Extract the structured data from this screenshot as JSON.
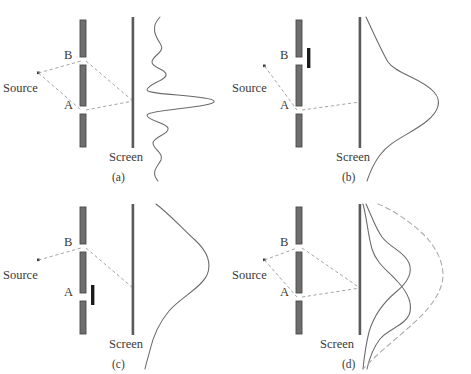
{
  "figure": {
    "colors": {
      "barrier": "#6e6e6e",
      "barrier_edge": "#4a4a4a",
      "blocker": "#1a1a1a",
      "screen": "#5a5a5a",
      "ray": "#9a9a9a",
      "curve": "#6a6a6a",
      "dashed_curve": "#a8a8a8",
      "text": "#3a3a3a",
      "background": "#ffffff"
    },
    "labels": {
      "source": "Source",
      "slit_a": "A",
      "slit_b": "B",
      "screen": "Screen"
    }
  },
  "panels": [
    {
      "id": "a",
      "caption": "(a)",
      "source_label": "Source",
      "slit_b_label": "B",
      "slit_a_label": "A",
      "screen_label": "Screen",
      "slit_a_open": true,
      "slit_b_open": true,
      "rays": [
        "source-to-B",
        "B-to-screen",
        "source-to-A",
        "A-to-screen"
      ],
      "pattern": "two-slit interference fringes",
      "curves": [
        {
          "style": "solid",
          "kind": "interference"
        }
      ]
    },
    {
      "id": "b",
      "caption": "(b)",
      "source_label": "Source",
      "slit_b_label": "B",
      "slit_a_label": "A",
      "screen_label": "Screen",
      "slit_a_open": true,
      "slit_b_open": false,
      "rays": [
        "source-to-A",
        "A-to-screen"
      ],
      "pattern": "single-slit broad maximum through A",
      "curves": [
        {
          "style": "solid",
          "kind": "single-slit-A"
        }
      ]
    },
    {
      "id": "c",
      "caption": "(c)",
      "source_label": "Source",
      "slit_b_label": "B",
      "slit_a_label": "A",
      "screen_label": "Screen",
      "slit_a_open": false,
      "slit_b_open": true,
      "rays": [
        "source-to-B",
        "B-to-screen"
      ],
      "pattern": "single-slit broad maximum through B",
      "curves": [
        {
          "style": "solid",
          "kind": "single-slit-B"
        }
      ]
    },
    {
      "id": "d",
      "caption": "(d)",
      "source_label": "Source",
      "slit_b_label": "B",
      "slit_a_label": "A",
      "screen_label": "Screen",
      "slit_a_open": true,
      "slit_b_open": true,
      "rays": [
        "source-to-B",
        "B-to-screen",
        "source-to-A",
        "A-to-screen"
      ],
      "pattern": "two single-slit curves plus dashed classical sum",
      "curves": [
        {
          "style": "solid",
          "kind": "single-slit-A"
        },
        {
          "style": "solid",
          "kind": "single-slit-B"
        },
        {
          "style": "dashed",
          "kind": "sum-of-A-and-B"
        }
      ]
    }
  ]
}
